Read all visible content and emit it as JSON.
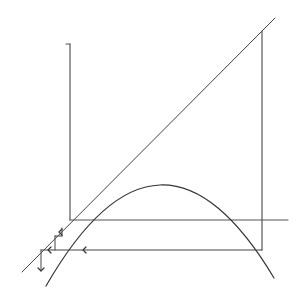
{
  "diagram": {
    "type": "cobweb-plot",
    "colors": {
      "background": "#ffffff",
      "stroke": "#3a3a3a",
      "axis": "#555555",
      "curve": "#333333",
      "identity": "#444444"
    },
    "y_axis": {
      "x": 70,
      "y1": 44,
      "y2": 220,
      "tick": {
        "x1": 66,
        "x2": 70,
        "y": 44
      }
    },
    "x_axis": {
      "y": 220,
      "x1": 70,
      "x2": 288
    },
    "identity_line": {
      "x1": 22,
      "y1": 272,
      "x2": 275,
      "y2": 18
    },
    "right_vertical": {
      "x": 262,
      "y1": 31,
      "y2": 250
    },
    "parabola": {
      "start": {
        "x": 46,
        "y": 286
      },
      "control": {
        "x": 160,
        "y": 88
      },
      "end": {
        "x": 274,
        "y": 278
      },
      "peak": {
        "x": 160,
        "y": 154
      }
    },
    "iteration_line": {
      "y": 250,
      "x1": 41,
      "x2": 262
    },
    "arrows": [
      {
        "name": "left-arrow-1",
        "x": 83,
        "y": 250,
        "dir": "left"
      },
      {
        "name": "left-arrow-2",
        "x": 48,
        "y": 250,
        "dir": "left"
      },
      {
        "name": "down-arrow",
        "x": 41,
        "y": 271,
        "dir": "down"
      },
      {
        "name": "inner-arrow",
        "x": 59,
        "y": 232,
        "dir": "left"
      }
    ],
    "cobweb_segments": [
      {
        "x1": 41,
        "y1": 250,
        "x2": 41,
        "y2": 271
      },
      {
        "x1": 55,
        "y1": 236,
        "x2": 55,
        "y2": 250
      },
      {
        "x1": 55,
        "y1": 236,
        "x2": 62,
        "y2": 236
      },
      {
        "x1": 62,
        "y1": 228,
        "x2": 62,
        "y2": 236
      }
    ]
  }
}
